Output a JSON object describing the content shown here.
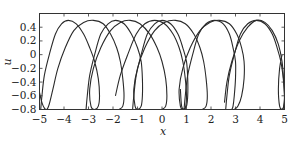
{
  "chart_data": {
    "type": "line",
    "title": "",
    "xlabel": "x",
    "ylabel": "u",
    "xlim": [
      -5,
      5
    ],
    "ylim": [
      -0.8,
      0.6
    ],
    "grid": false,
    "legend": null,
    "x_ticks": [
      -5,
      -4,
      -3,
      -2,
      -1,
      0,
      1,
      2,
      3,
      4,
      5
    ],
    "x_tick_labels": [
      "−5",
      "−4",
      "−3",
      "−2",
      "−1",
      "0",
      "1",
      "2",
      "3",
      "4",
      "5"
    ],
    "y_ticks": [
      0.4,
      0.2,
      0,
      -0.2,
      -0.4,
      -0.6,
      -0.8
    ],
    "y_tick_labels": [
      "0.4",
      "0.2",
      "0",
      "−0.2",
      "−0.4",
      "−0.6",
      "−0.8"
    ],
    "series": [
      {
        "name": "curve-1",
        "peaks_x": [
          -3.82,
          0.55
        ],
        "loop_x": [
          -4.95,
          -1.0,
          2.9
        ],
        "points": [
          [
            -4.95,
            -0.8
          ],
          [
            -4.9,
            -0.6
          ],
          [
            -4.8,
            -0.3
          ],
          [
            -4.6,
            0.0
          ],
          [
            -4.35,
            0.3
          ],
          [
            -4.1,
            0.45
          ],
          [
            -3.82,
            0.5
          ],
          [
            -3.5,
            0.45
          ],
          [
            -3.2,
            0.3
          ],
          [
            -2.95,
            0.1
          ],
          [
            -2.75,
            -0.1
          ],
          [
            -2.6,
            -0.35
          ],
          [
            -2.55,
            -0.6
          ],
          [
            -2.6,
            -0.75
          ],
          [
            -2.75,
            -0.8
          ],
          [
            -2.9,
            -0.75
          ],
          [
            -2.95,
            -0.5
          ],
          [
            -2.8,
            -0.2
          ],
          [
            -2.5,
            0.1
          ],
          [
            -2.1,
            0.35
          ],
          [
            -1.7,
            0.47
          ],
          [
            -1.3,
            0.5
          ],
          [
            -0.9,
            0.45
          ],
          [
            -0.5,
            0.3
          ],
          [
            -0.2,
            0.1
          ],
          [
            0.0,
            -0.1
          ],
          [
            0.15,
            -0.35
          ],
          [
            0.2,
            -0.6
          ],
          [
            0.15,
            -0.75
          ],
          [
            0.0,
            -0.8
          ]
        ]
      },
      {
        "name": "curve-2",
        "peaks_x": [
          -2.84,
          1.65
        ],
        "points": [
          [
            -3.1,
            -0.8
          ],
          [
            -3.05,
            -0.6
          ],
          [
            -2.95,
            -0.3
          ],
          [
            -2.75,
            0.0
          ],
          [
            -2.5,
            0.3
          ],
          [
            -2.2,
            0.45
          ],
          [
            -1.9,
            0.5
          ],
          [
            -1.55,
            0.45
          ],
          [
            -1.25,
            0.3
          ],
          [
            -1.0,
            0.1
          ],
          [
            -0.85,
            -0.1
          ],
          [
            -0.8,
            -0.35
          ],
          [
            -0.8,
            -0.6
          ],
          [
            -0.85,
            -0.75
          ],
          [
            -1.0,
            -0.8
          ],
          [
            -1.1,
            -0.75
          ],
          [
            -1.15,
            -0.5
          ],
          [
            -1.0,
            -0.2
          ],
          [
            -0.7,
            0.1
          ],
          [
            -0.3,
            0.35
          ],
          [
            0.1,
            0.47
          ],
          [
            0.55,
            0.5
          ],
          [
            0.95,
            0.45
          ],
          [
            1.3,
            0.3
          ],
          [
            1.55,
            0.1
          ],
          [
            1.7,
            -0.1
          ],
          [
            1.8,
            -0.35
          ],
          [
            1.85,
            -0.6
          ],
          [
            1.8,
            -0.75
          ],
          [
            1.65,
            -0.8
          ]
        ]
      },
      {
        "name": "curve-3",
        "peaks_x": [
          -1.78,
          2.51
        ],
        "points": [
          [
            -1.2,
            -0.8
          ],
          [
            -1.15,
            -0.6
          ],
          [
            -1.05,
            -0.3
          ],
          [
            -0.85,
            0.0
          ],
          [
            -0.6,
            0.3
          ],
          [
            -0.3,
            0.45
          ],
          [
            0.0,
            0.5
          ],
          [
            0.35,
            0.45
          ],
          [
            0.65,
            0.3
          ],
          [
            0.85,
            0.1
          ],
          [
            1.0,
            -0.1
          ],
          [
            1.05,
            -0.35
          ],
          [
            1.05,
            -0.6
          ],
          [
            1.0,
            -0.75
          ],
          [
            0.85,
            -0.8
          ],
          [
            0.75,
            -0.75
          ],
          [
            0.7,
            -0.5
          ],
          [
            0.85,
            -0.2
          ],
          [
            1.15,
            0.1
          ],
          [
            1.55,
            0.35
          ],
          [
            1.95,
            0.47
          ],
          [
            2.35,
            0.5
          ],
          [
            2.75,
            0.45
          ],
          [
            3.05,
            0.3
          ],
          [
            3.25,
            0.1
          ],
          [
            3.35,
            -0.1
          ],
          [
            3.35,
            -0.35
          ],
          [
            3.25,
            -0.6
          ],
          [
            3.1,
            -0.75
          ],
          [
            2.95,
            -0.8
          ]
        ]
      },
      {
        "name": "curve-4",
        "peaks_x": [
          -0.76,
          3.94
        ],
        "points": [
          [
            2.6,
            -0.8
          ],
          [
            2.65,
            -0.6
          ],
          [
            2.75,
            -0.3
          ],
          [
            2.95,
            0.0
          ],
          [
            3.2,
            0.3
          ],
          [
            3.5,
            0.45
          ],
          [
            3.85,
            0.5
          ],
          [
            4.2,
            0.45
          ],
          [
            4.5,
            0.3
          ],
          [
            4.7,
            0.1
          ],
          [
            4.85,
            -0.1
          ],
          [
            4.95,
            -0.35
          ],
          [
            5.0,
            -0.6
          ],
          [
            4.97,
            -0.75
          ],
          [
            4.9,
            -0.8
          ],
          [
            4.8,
            -0.75
          ],
          [
            4.75,
            -0.5
          ],
          [
            4.8,
            -0.2
          ],
          [
            4.9,
            0.0
          ]
        ]
      },
      {
        "name": "curve-5",
        "points": [
          [
            -5.0,
            -0.55
          ],
          [
            -4.9,
            -0.7
          ],
          [
            -4.8,
            -0.78
          ],
          [
            -4.7,
            -0.8
          ],
          [
            -4.6,
            -0.72
          ],
          [
            -4.45,
            -0.5
          ],
          [
            -4.25,
            -0.2
          ],
          [
            -3.95,
            0.1
          ],
          [
            -3.6,
            0.35
          ],
          [
            -3.2,
            0.47
          ],
          [
            -2.8,
            0.5
          ],
          [
            -2.4,
            0.45
          ],
          [
            -2.1,
            0.3
          ],
          [
            -1.85,
            0.1
          ],
          [
            -1.7,
            -0.1
          ],
          [
            -1.6,
            -0.35
          ],
          [
            -1.55,
            -0.6
          ],
          [
            -1.6,
            -0.75
          ],
          [
            -1.75,
            -0.8
          ]
        ]
      },
      {
        "name": "curve-6",
        "points": [
          [
            -1.9,
            -0.6
          ],
          [
            -1.7,
            -0.3
          ],
          [
            -1.4,
            0.0
          ],
          [
            -1.05,
            0.3
          ],
          [
            -0.7,
            0.45
          ],
          [
            -0.3,
            0.5
          ],
          [
            0.1,
            0.45
          ],
          [
            0.45,
            0.3
          ],
          [
            0.7,
            0.1
          ],
          [
            0.85,
            -0.1
          ],
          [
            0.95,
            -0.35
          ],
          [
            1.0,
            -0.6
          ],
          [
            0.97,
            -0.75
          ],
          [
            0.9,
            -0.8
          ],
          [
            0.8,
            -0.75
          ],
          [
            0.75,
            -0.5
          ]
        ]
      },
      {
        "name": "curve-7",
        "points": [
          [
            0.9,
            -0.8
          ],
          [
            0.95,
            -0.6
          ],
          [
            1.05,
            -0.3
          ],
          [
            1.25,
            0.0
          ],
          [
            1.5,
            0.3
          ],
          [
            1.8,
            0.45
          ],
          [
            2.15,
            0.5
          ],
          [
            2.5,
            0.45
          ],
          [
            2.75,
            0.3
          ],
          [
            2.9,
            0.1
          ],
          [
            3.0,
            -0.1
          ],
          [
            3.0,
            -0.35
          ],
          [
            2.95,
            -0.6
          ],
          [
            2.9,
            -0.75
          ],
          [
            2.85,
            -0.8
          ]
        ]
      },
      {
        "name": "curve-8",
        "points": [
          [
            2.55,
            -0.7
          ],
          [
            2.65,
            -0.4
          ],
          [
            2.85,
            -0.1
          ],
          [
            3.15,
            0.2
          ],
          [
            3.5,
            0.4
          ],
          [
            3.85,
            0.5
          ],
          [
            4.2,
            0.47
          ],
          [
            4.5,
            0.35
          ],
          [
            4.75,
            0.15
          ],
          [
            4.9,
            -0.1
          ],
          [
            4.97,
            -0.4
          ],
          [
            5.0,
            -0.65
          ],
          [
            4.95,
            -0.78
          ],
          [
            4.85,
            -0.8
          ]
        ]
      }
    ]
  }
}
